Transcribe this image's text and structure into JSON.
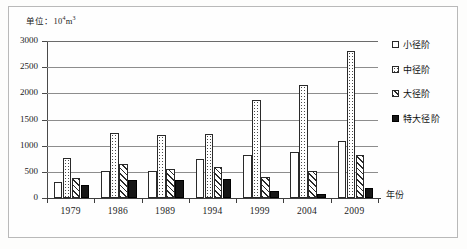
{
  "figure": {
    "unit_label": "单位：10",
    "unit_exp": "4",
    "unit_tail": "m",
    "unit_tail_exp": "3"
  },
  "chart_data": {
    "type": "bar",
    "title": "",
    "subtitle": "",
    "xlabel": "年份",
    "ylabel": "",
    "unit_note": "单位：10⁴m³",
    "categories": [
      "1979",
      "1986",
      "1989",
      "1994",
      "1999",
      "2004",
      "2009"
    ],
    "ylim": [
      0,
      3000
    ],
    "yticks": [
      0,
      500,
      1000,
      1500,
      2000,
      2500,
      3000
    ],
    "ytick_labels": [
      "0",
      "500",
      "1000",
      "1500",
      "2000",
      "2500",
      "3000"
    ],
    "grid": true,
    "legend_position": "right",
    "series": [
      {
        "name": "小径阶",
        "fill": "white",
        "values": [
          310,
          510,
          510,
          740,
          830,
          870,
          1090
        ]
      },
      {
        "name": "中径阶",
        "fill": "dotted",
        "values": [
          760,
          1240,
          1210,
          1215,
          1870,
          2160,
          2800
        ]
      },
      {
        "name": "大径阶",
        "fill": "hatch",
        "values": [
          390,
          650,
          555,
          590,
          395,
          525,
          820
        ]
      },
      {
        "name": "特大径阶",
        "fill": "solid",
        "values": [
          250,
          350,
          345,
          360,
          140,
          75,
          190
        ]
      }
    ]
  },
  "legend": {
    "items": [
      {
        "label": "小径阶",
        "key": "legend-key-small"
      },
      {
        "label": "中径阶",
        "key": "legend-key-medium"
      },
      {
        "label": "大径阶",
        "key": "legend-key-large"
      },
      {
        "label": "特大径阶",
        "key": "legend-key-extralarge"
      }
    ]
  }
}
